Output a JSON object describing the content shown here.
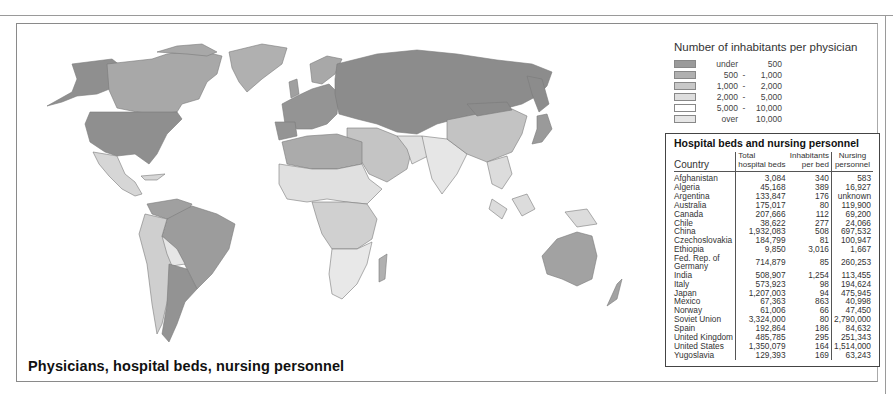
{
  "title": "Physicians, hospital beds, nursing personnel",
  "legend": {
    "title": "Number of inhabitants per physician",
    "items": [
      {
        "lo": "under",
        "sep": "",
        "hi": "500",
        "color": "#9a9a9a"
      },
      {
        "lo": "500",
        "sep": "-",
        "hi": "1,000",
        "color": "#b0b0b0"
      },
      {
        "lo": "1,000",
        "sep": "-",
        "hi": "2,000",
        "color": "#c8c8c8"
      },
      {
        "lo": "2,000",
        "sep": "-",
        "hi": "5,000",
        "color": "#dedede"
      },
      {
        "lo": "5,000",
        "sep": "-",
        "hi": "10,000",
        "color": "#ffffff"
      },
      {
        "lo": "over",
        "sep": "",
        "hi": "10,000",
        "color": "#e6e6e6"
      }
    ]
  },
  "table": {
    "title": "Hospital beds and nursing personnel",
    "headers": {
      "country": "Country",
      "beds_1": "Total",
      "beds_2": "hospital beds",
      "inh_1": "Inhabitants",
      "inh_2": "per bed",
      "nurse_1": "Nursing",
      "nurse_2": "personnel"
    },
    "rows": [
      {
        "country": "Afghanistan",
        "beds": "3,084",
        "per_bed": "340",
        "nursing": "583"
      },
      {
        "country": "Algeria",
        "beds": "45,168",
        "per_bed": "389",
        "nursing": "16,927"
      },
      {
        "country": "Argentina",
        "beds": "133,847",
        "per_bed": "176",
        "nursing": "unknown"
      },
      {
        "country": "Australia",
        "beds": "175,017",
        "per_bed": "80",
        "nursing": "119,900"
      },
      {
        "country": "Canada",
        "beds": "207,666",
        "per_bed": "112",
        "nursing": "69,200"
      },
      {
        "country": "Chile",
        "beds": "38,622",
        "per_bed": "277",
        "nursing": "24,066"
      },
      {
        "country": "China",
        "beds": "1,932,083",
        "per_bed": "508",
        "nursing": "697,532"
      },
      {
        "country": "Czechoslovakia",
        "beds": "184,799",
        "per_bed": "81",
        "nursing": "100,947"
      },
      {
        "country": "Ethiopia",
        "beds": "9,850",
        "per_bed": "3,016",
        "nursing": "1,667"
      },
      {
        "country": "Fed. Rep. of Germany",
        "beds": "714,879",
        "per_bed": "85",
        "nursing": "260,253"
      },
      {
        "country": "India",
        "beds": "508,907",
        "per_bed": "1,254",
        "nursing": "113,455"
      },
      {
        "country": "Italy",
        "beds": "573,923",
        "per_bed": "98",
        "nursing": "194,624"
      },
      {
        "country": "Japan",
        "beds": "1,207,003",
        "per_bed": "94",
        "nursing": "475,945"
      },
      {
        "country": "Mexico",
        "beds": "67,363",
        "per_bed": "863",
        "nursing": "40,998"
      },
      {
        "country": "Norway",
        "beds": "61,006",
        "per_bed": "66",
        "nursing": "47,450"
      },
      {
        "country": "Soviet Union",
        "beds": "3,324,000",
        "per_bed": "80",
        "nursing": "2,790,000"
      },
      {
        "country": "Spain",
        "beds": "192,864",
        "per_bed": "186",
        "nursing": "84,632"
      },
      {
        "country": "United Kingdom",
        "beds": "485,785",
        "per_bed": "295",
        "nursing": "251,343"
      },
      {
        "country": "United States",
        "beds": "1,350,079",
        "per_bed": "164",
        "nursing": "1,514,000"
      },
      {
        "country": "Yugoslavia",
        "beds": "129,393",
        "per_bed": "169",
        "nursing": "63,243"
      }
    ]
  },
  "map_regions": {
    "north_america_canada": "#a8a8a8",
    "usa": "#8f8f8f",
    "greenland": "#b0b0b0",
    "mexico_central": "#d6d6d6",
    "south_america_north": "#a0a0a0",
    "brazil": "#9c9c9c",
    "argentina": "#939393",
    "andes": "#cfcfcf",
    "europe": "#949494",
    "soviet_union": "#8c8c8c",
    "north_africa": "#ababab",
    "sahel_africa": "#e0e0e0",
    "central_africa": "#d0d0d0",
    "southern_africa": "#e8e8e8",
    "middle_east": "#c4c4c4",
    "south_asia": "#e6e6e6",
    "china": "#c3c3c3",
    "japan": "#9a9a9a",
    "southeast_asia": "#dcdcdc",
    "australia": "#a2a2a2"
  }
}
